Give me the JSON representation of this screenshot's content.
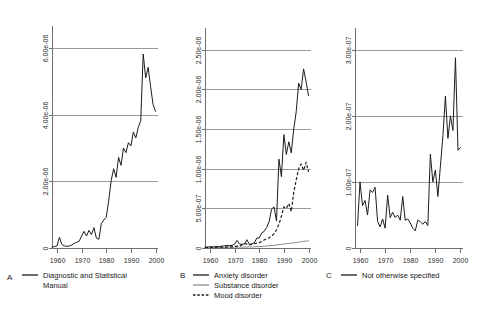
{
  "figure": {
    "background": "#ffffff",
    "series_colors": {
      "dark": "#1c1c1c",
      "gray": "#8c8c8c",
      "grid": "#9a9a9a",
      "axis": "#6e6e6e"
    }
  },
  "chart_data": [
    {
      "type": "line",
      "panel_label": "A",
      "title": "",
      "xlabel": "",
      "ylabel": "",
      "grid": true,
      "legend_position": "below",
      "xlim": [
        1958,
        2001
      ],
      "ylim": [
        0,
        6.6e-06
      ],
      "xticks": [
        1960,
        1970,
        1980,
        1990,
        2000
      ],
      "xtick_labels": [
        "1960",
        "1970",
        "1980",
        "1990",
        "2000"
      ],
      "yticks": [
        0,
        2e-06,
        4e-06,
        6e-06
      ],
      "ytick_labels": [
        "0",
        "2.00e-06",
        "4.00e-06",
        "6.00e-06"
      ],
      "series": [
        {
          "name": "Diagnostic and Statistical Manual",
          "style": "solid",
          "color": "dark",
          "x": [
            1958,
            1959,
            1960,
            1961,
            1962,
            1963,
            1964,
            1965,
            1966,
            1967,
            1968,
            1969,
            1970,
            1971,
            1972,
            1973,
            1974,
            1975,
            1976,
            1977,
            1978,
            1979,
            1980,
            1981,
            1982,
            1983,
            1984,
            1985,
            1986,
            1987,
            1988,
            1989,
            1990,
            1991,
            1992,
            1993,
            1994,
            1995,
            1996,
            1997,
            1998,
            1999,
            2000
          ],
          "y": [
            3e-08,
            4e-08,
            6e-08,
            3.2e-07,
            1.1e-07,
            6e-08,
            5e-08,
            6e-08,
            9e-08,
            1.4e-07,
            1.7e-07,
            2e-07,
            3.6e-07,
            5e-07,
            3.6e-07,
            5.3e-07,
            4e-07,
            6.1e-07,
            3e-07,
            2.6e-07,
            7.3e-07,
            8.4e-07,
            9.2e-07,
            1.42e-06,
            2.02e-06,
            2.38e-06,
            2.12e-06,
            2.72e-06,
            2.48e-06,
            3e-06,
            2.86e-06,
            3.16e-06,
            3.06e-06,
            3.48e-06,
            3.3e-06,
            3.62e-06,
            3.82e-06,
            5.82e-06,
            5.1e-06,
            5.42e-06,
            4.84e-06,
            4.3e-06,
            4.1e-06
          ]
        }
      ]
    },
    {
      "type": "line",
      "panel_label": "B",
      "title": "",
      "xlabel": "",
      "ylabel": "",
      "grid": true,
      "legend_position": "below",
      "xlim": [
        1958,
        2001
      ],
      "ylim": [
        0,
        2.75e-06
      ],
      "xticks": [
        1960,
        1970,
        1980,
        1990,
        2000
      ],
      "xtick_labels": [
        "1960",
        "1970",
        "1980",
        "1990",
        "2000"
      ],
      "yticks": [
        0,
        5e-07,
        1e-06,
        1.5e-06,
        2e-06,
        2.5e-06
      ],
      "ytick_labels": [
        "0",
        "5.00e-07",
        "1.00e-06",
        "1.50e-06",
        "2.00e-06",
        "2.50e-06"
      ],
      "series": [
        {
          "name": "Anxiety disorder",
          "style": "solid",
          "color": "dark",
          "x": [
            1958,
            1959,
            1960,
            1961,
            1962,
            1963,
            1964,
            1965,
            1966,
            1967,
            1968,
            1969,
            1970,
            1971,
            1972,
            1973,
            1974,
            1975,
            1976,
            1977,
            1978,
            1979,
            1980,
            1981,
            1982,
            1983,
            1984,
            1985,
            1986,
            1987,
            1988,
            1989,
            1990,
            1991,
            1992,
            1993,
            1994,
            1995,
            1996,
            1997,
            1998,
            1999,
            2000
          ],
          "y": [
            1e-08,
            1.2e-08,
            1.5e-08,
            1.4e-08,
            1.6e-08,
            1.8e-08,
            2e-08,
            2.4e-08,
            2.8e-08,
            3.2e-08,
            3e-08,
            3.4e-08,
            4.8e-08,
            9.5e-08,
            5e-08,
            4.6e-08,
            5.2e-08,
            1.05e-07,
            4.4e-08,
            5.2e-08,
            6.6e-08,
            1.24e-07,
            1.26e-07,
            1.9e-07,
            2.1e-07,
            2.6e-07,
            3.3e-07,
            4.9e-07,
            5.2e-07,
            3.4e-07,
            1.12e-06,
            9e-07,
            1.43e-06,
            1.18e-06,
            1.34e-06,
            1.2e-06,
            1.5e-06,
            1.72e-06,
            2.08e-06,
            2e-06,
            2.26e-06,
            2.1e-06,
            1.92e-06
          ]
        },
        {
          "name": "Substance disorder",
          "style": "solid",
          "color": "gray",
          "x": [
            1958,
            1960,
            1962,
            1964,
            1966,
            1968,
            1970,
            1972,
            1974,
            1976,
            1978,
            1980,
            1982,
            1984,
            1986,
            1988,
            1990,
            1992,
            1994,
            1996,
            1998,
            2000
          ],
          "y": [
            4e-09,
            5e-09,
            6e-09,
            7e-09,
            8e-09,
            9e-09,
            1e-08,
            1.1e-08,
            1.2e-08,
            1.3e-08,
            1.5e-08,
            1.8e-08,
            2.2e-08,
            2.8e-08,
            3.4e-08,
            4.2e-08,
            5e-08,
            5.8e-08,
            6.4e-08,
            7.4e-08,
            8.4e-08,
            9e-08
          ]
        },
        {
          "name": "Mood disorder",
          "style": "dashed",
          "color": "dark",
          "x": [
            1958,
            1960,
            1962,
            1964,
            1966,
            1968,
            1970,
            1972,
            1974,
            1975,
            1976,
            1978,
            1980,
            1981,
            1982,
            1983,
            1984,
            1985,
            1986,
            1987,
            1988,
            1989,
            1990,
            1991,
            1992,
            1993,
            1994,
            1995,
            1996,
            1997,
            1998,
            1999,
            2000
          ],
          "y": [
            6e-09,
            8e-09,
            9e-09,
            1e-08,
            1.2e-08,
            1.4e-08,
            2e-08,
            2.4e-08,
            5.6e-08,
            5e-08,
            4e-08,
            5.4e-08,
            6.8e-08,
            8.2e-08,
            1e-07,
            1.16e-07,
            1.3e-07,
            1.5e-07,
            1.8e-07,
            2.3e-07,
            3e-07,
            4e-07,
            5.2e-07,
            5e-07,
            5.6e-07,
            4.6e-07,
            7e-07,
            8.6e-07,
            1e-06,
            1.06e-06,
            9.8e-07,
            1.08e-06,
            9.6e-07
          ]
        }
      ]
    },
    {
      "type": "line",
      "panel_label": "C",
      "title": "",
      "xlabel": "",
      "ylabel": "",
      "grid": true,
      "legend_position": "below",
      "xlim": [
        1958,
        2001
      ],
      "ylim": [
        0,
        3.3e-07
      ],
      "xticks": [
        1960,
        1970,
        1980,
        1990,
        2000
      ],
      "xtick_labels": [
        "1960",
        "1970",
        "1980",
        "1990",
        "2000"
      ],
      "yticks": [
        0,
        1e-07,
        2e-07,
        3e-07
      ],
      "ytick_labels": [
        "0",
        "1.00e-07",
        "2.00e-07",
        "3.00e-07"
      ],
      "series": [
        {
          "name": "Not otherwise specified",
          "style": "solid",
          "color": "dark",
          "x": [
            1959,
            1960,
            1961,
            1962,
            1963,
            1964,
            1965,
            1966,
            1967,
            1968,
            1969,
            1970,
            1971,
            1972,
            1973,
            1974,
            1975,
            1976,
            1977,
            1978,
            1979,
            1980,
            1981,
            1982,
            1983,
            1984,
            1985,
            1986,
            1987,
            1988,
            1989,
            1990,
            1991,
            1992,
            1993,
            1994,
            1995,
            1996,
            1997,
            1998,
            1999,
            2000
          ],
          "y": [
            3.4e-08,
            1e-07,
            6.4e-08,
            7.2e-08,
            5e-08,
            8.8e-08,
            8.4e-08,
            9.2e-08,
            4e-08,
            3.2e-08,
            4.4e-08,
            3e-08,
            8e-08,
            4.6e-08,
            5.4e-08,
            4.6e-08,
            5e-08,
            4.2e-08,
            7.8e-08,
            4.2e-08,
            4.4e-08,
            3.8e-08,
            3e-08,
            2.6e-08,
            4.2e-08,
            4e-08,
            3.6e-08,
            4e-08,
            3.4e-08,
            1.42e-07,
            1e-07,
            1.18e-07,
            7.8e-08,
            1.24e-07,
            1.7e-07,
            2.3e-07,
            1.66e-07,
            2e-07,
            1.78e-07,
            2.88e-07,
            1.48e-07,
            1.52e-07
          ]
        }
      ]
    }
  ],
  "panels": [
    {
      "letter": "A",
      "legend": [
        {
          "label": "Diagnostic and Statistical",
          "label2": "Manual",
          "style": "solid",
          "color": "dark"
        }
      ]
    },
    {
      "letter": "B",
      "legend": [
        {
          "label": "Anxiety disorder",
          "style": "solid",
          "color": "dark"
        },
        {
          "label": "Substance disorder",
          "style": "solid",
          "color": "gray"
        },
        {
          "label": "Mood disorder",
          "style": "dashed",
          "color": "dark"
        }
      ]
    },
    {
      "letter": "C",
      "legend": [
        {
          "label": "Not otherwise specified",
          "style": "solid",
          "color": "dark"
        }
      ]
    }
  ]
}
